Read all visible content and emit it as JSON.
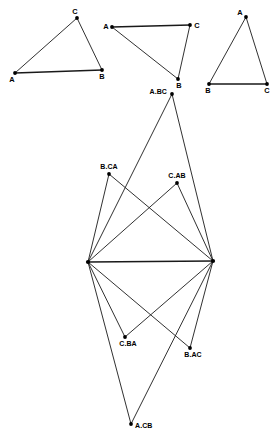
{
  "figure": {
    "stroke_color": "#1a1a1a",
    "vertex_color": "#000000",
    "background_color": "#ffffff",
    "triangles": [
      {
        "name": "triangle-1",
        "vertices": [
          {
            "label": "A",
            "x": 15,
            "y": 73,
            "label_dx": -3,
            "label_dy": 9,
            "anchor": "middle"
          },
          {
            "label": "B",
            "x": 102,
            "y": 70,
            "label_dx": 0,
            "label_dy": 9,
            "anchor": "middle"
          },
          {
            "label": "C",
            "x": 77,
            "y": 18,
            "label_dx": -2,
            "label_dy": -4,
            "anchor": "middle"
          }
        ],
        "edges": [
          [
            0,
            1
          ],
          [
            1,
            2
          ],
          [
            2,
            0
          ]
        ],
        "base_edge": [
          0,
          1
        ]
      },
      {
        "name": "triangle-2",
        "vertices": [
          {
            "label": "A",
            "x": 112,
            "y": 27,
            "label_dx": -6,
            "label_dy": 2,
            "anchor": "middle"
          },
          {
            "label": "B",
            "x": 178,
            "y": 79,
            "label_dx": 1,
            "label_dy": 9,
            "anchor": "middle"
          },
          {
            "label": "C",
            "x": 190,
            "y": 25,
            "label_dx": 7,
            "label_dy": 3,
            "anchor": "middle"
          }
        ],
        "edges": [
          [
            0,
            2
          ],
          [
            2,
            1
          ],
          [
            1,
            0
          ]
        ],
        "base_edge": [
          0,
          2
        ]
      },
      {
        "name": "triangle-3",
        "vertices": [
          {
            "label": "A",
            "x": 246,
            "y": 17,
            "label_dx": -6,
            "label_dy": -2,
            "anchor": "middle"
          },
          {
            "label": "B",
            "x": 209,
            "y": 84,
            "label_dx": -1,
            "label_dy": 9,
            "anchor": "middle"
          },
          {
            "label": "C",
            "x": 267,
            "y": 84,
            "label_dx": 0,
            "label_dy": 9,
            "anchor": "middle"
          }
        ],
        "edges": [
          [
            0,
            1
          ],
          [
            1,
            2
          ],
          [
            2,
            0
          ]
        ],
        "base_edge": [
          1,
          2
        ]
      }
    ],
    "main_figure": {
      "name": "main-cevian-figure",
      "hubs": [
        {
          "name": "hub-left",
          "x": 88,
          "y": 262
        },
        {
          "name": "hub-right",
          "x": 213,
          "y": 261
        }
      ],
      "nodes": [
        {
          "label": "A.BC",
          "x": 172,
          "y": 94,
          "label_dx": -5,
          "label_dy": -0.5,
          "anchor": "end"
        },
        {
          "label": "B.CA",
          "x": 109,
          "y": 174,
          "label_dx": 0,
          "label_dy": -5,
          "anchor": "middle"
        },
        {
          "label": "C.AB",
          "x": 177,
          "y": 183,
          "label_dx": 0,
          "label_dy": -5,
          "anchor": "middle"
        },
        {
          "label": "C.BA",
          "x": 125,
          "y": 337,
          "label_dx": 3,
          "label_dy": 9,
          "anchor": "middle"
        },
        {
          "label": "B.AC",
          "x": 190,
          "y": 348,
          "label_dx": 3,
          "label_dy": 9,
          "anchor": "middle"
        },
        {
          "label": "A.CB",
          "x": 131,
          "y": 424,
          "label_dx": 4,
          "label_dy": 3.5,
          "anchor": "start"
        }
      ],
      "hub_edge": {
        "from": "hub-left",
        "to": "hub-right"
      },
      "spokes": [
        {
          "from": "hub-left",
          "to": "A.BC"
        },
        {
          "from": "hub-left",
          "to": "B.CA"
        },
        {
          "from": "hub-left",
          "to": "C.AB"
        },
        {
          "from": "hub-left",
          "to": "C.BA"
        },
        {
          "from": "hub-left",
          "to": "B.AC"
        },
        {
          "from": "hub-left",
          "to": "A.CB"
        },
        {
          "from": "hub-right",
          "to": "A.BC"
        },
        {
          "from": "hub-right",
          "to": "B.CA"
        },
        {
          "from": "hub-right",
          "to": "C.AB"
        },
        {
          "from": "hub-right",
          "to": "C.BA"
        },
        {
          "from": "hub-right",
          "to": "B.AC"
        },
        {
          "from": "hub-right",
          "to": "A.CB"
        }
      ]
    }
  }
}
